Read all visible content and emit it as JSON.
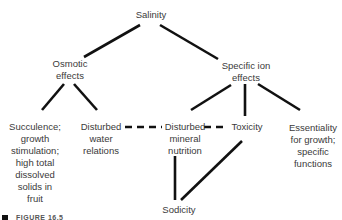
{
  "nodes": {
    "salinity": "Salinity",
    "osmotic": "Osmotic\neffects",
    "specific_ion": "Specific ion\neffects",
    "succulence": "Succulence;\ngrowth\nstimulation;\nhigh total\ndissolved\nsolids in\nfruit",
    "water": "Disturbed\nwater\nrelations",
    "mineral": "Disturbed\nmineral\nnutrition",
    "toxicity": "Toxicity",
    "essentiality": "Essentiality\nfor growth;\nspecific\nfunctions",
    "sodicity": "Sodicity"
  },
  "caption": "FIGURE 16.5"
}
